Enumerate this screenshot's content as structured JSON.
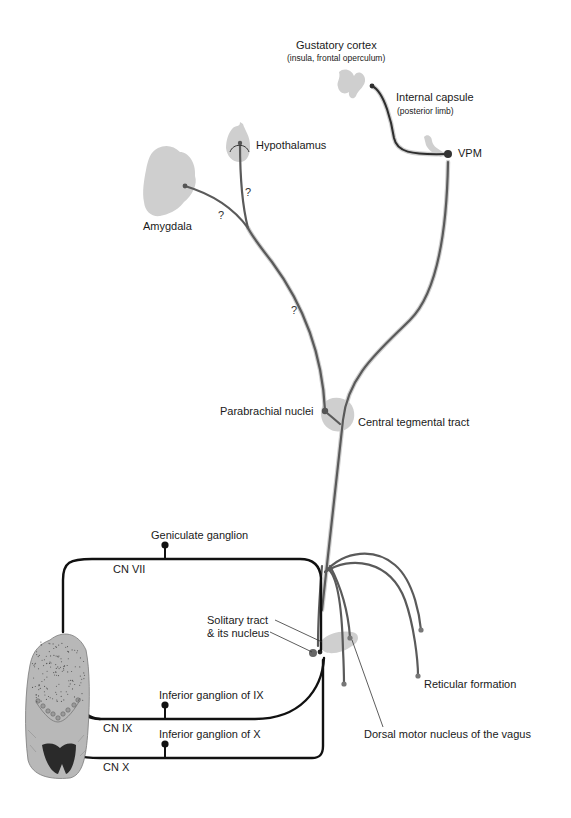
{
  "labels": {
    "gustatory_cortex": "Gustatory cortex",
    "gustatory_cortex_sub": "(insula, frontal operculum)",
    "internal_capsule": "Internal capsule",
    "internal_capsule_sub": "(posterior limb)",
    "vpm": "VPM",
    "hypothalamus": "Hypothalamus",
    "amygdala": "Amygdala",
    "parabrachial": "Parabrachial nuclei",
    "central_tegmental": "Central tegmental tract",
    "geniculate": "Geniculate ganglion",
    "cn7": "CN VII",
    "solitary_1": "Solitary tract",
    "solitary_2": "& its nucleus",
    "inferior_ix": "Inferior ganglion of IX",
    "cn9": "CN IX",
    "inferior_x": "Inferior ganglion of X",
    "cn10": "CN X",
    "reticular": "Reticular formation",
    "dorsal_motor": "Dorsal motor nucleus of the vagus",
    "uncertain_mark": "?"
  },
  "colors": {
    "central_fiber": "#5a5a5a",
    "peripheral_fiber": "#111111",
    "region_fill": "#cfcfcf",
    "tongue_fill": "#b8b8b8",
    "epiglottis_fill": "#2a2a2a"
  }
}
